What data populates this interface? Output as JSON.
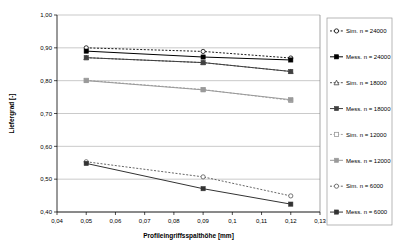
{
  "chart_data": {
    "type": "line",
    "title": "",
    "xlabel": "Profileingriffsspalthöhe [mm]",
    "ylabel": "Liefergrad [-]",
    "xlim": [
      0.04,
      0.13
    ],
    "ylim": [
      0.4,
      1.0
    ],
    "grid": true,
    "legend_position": "right",
    "x_ticks": [
      "0,04",
      "0,05",
      "0,06",
      "0,07",
      "0,08",
      "0,09",
      "0,1",
      "0,11",
      "0,12",
      "0,13"
    ],
    "x_tick_values": [
      0.04,
      0.05,
      0.06,
      0.07,
      0.08,
      0.09,
      0.1,
      0.11,
      0.12,
      0.13
    ],
    "y_ticks": [
      "0,40",
      "0,50",
      "0,60",
      "0,70",
      "0,80",
      "0,90",
      "1,00"
    ],
    "y_tick_values": [
      0.4,
      0.5,
      0.6,
      0.7,
      0.8,
      0.9,
      1.0
    ],
    "x": [
      0.05,
      0.09,
      0.12
    ],
    "series": [
      {
        "name": "Sim. n = 24000",
        "values": [
          0.9,
          0.889,
          0.869
        ],
        "style": "dashed",
        "marker": "open-circle",
        "color": "#000000"
      },
      {
        "name": "Mess. n = 24000",
        "values": [
          0.89,
          0.872,
          0.863
        ],
        "style": "solid",
        "marker": "filled-square",
        "color": "#000000"
      },
      {
        "name": "Sim. n = 18000",
        "values": [
          0.87,
          0.855,
          0.828
        ],
        "style": "dashed",
        "marker": "open-triangle",
        "color": "#404040"
      },
      {
        "name": "Mess. n = 18000",
        "values": [
          0.87,
          0.855,
          0.828
        ],
        "style": "solid",
        "marker": "filled-square",
        "color": "#404040"
      },
      {
        "name": "Sim. n = 12000",
        "values": [
          0.801,
          0.773,
          0.74
        ],
        "style": "dashed",
        "marker": "open-square",
        "color": "#9a9a9a"
      },
      {
        "name": "Mess. n = 12000",
        "values": [
          0.8,
          0.772,
          0.742
        ],
        "style": "solid",
        "marker": "filled-square",
        "color": "#9a9a9a"
      },
      {
        "name": "Sim. n = 6000",
        "values": [
          0.553,
          0.507,
          0.449
        ],
        "style": "dashed",
        "marker": "open-circle",
        "color": "#555555"
      },
      {
        "name": "Mess. n = 6000",
        "values": [
          0.548,
          0.471,
          0.424
        ],
        "style": "solid",
        "marker": "filled-square",
        "color": "#333333"
      }
    ]
  },
  "legend": {
    "items": [
      "Sim. n = 24000",
      "Mess. n = 24000",
      "Sim. n = 18000",
      "Mess. n = 18000",
      "Sim. n = 12000",
      "Mess. n = 12000",
      "Sim. n = 6000",
      "Mess. n = 6000"
    ]
  }
}
